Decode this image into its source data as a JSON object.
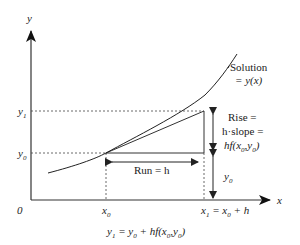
{
  "diagram": {
    "axes": {
      "y_label": "y",
      "x_label": "x",
      "origin_label": "0"
    },
    "labels": {
      "y1": "y",
      "y1_sub": "1",
      "y0": "y",
      "y0_sub": "0",
      "x0": "x",
      "x0_sub": "0",
      "x1_eq": "x",
      "x1_sub": "1",
      "x1_eq_rest_a": " = x",
      "x1_eq_rest_sub": "0",
      "x1_eq_rest_b": " + h",
      "solution_line1": "Solution",
      "solution_line2": "= y(x)",
      "rise_line1": "Rise =",
      "rise_line2": "h·slope =",
      "rise_line3_a": "hf(x",
      "rise_line3_sub1": "0",
      "rise_line3_b": ",y",
      "rise_line3_sub2": "0",
      "rise_line3_c": ")",
      "run": "Run = h",
      "y0_height": "y",
      "y0_height_sub": "0"
    },
    "formula": {
      "a": "y",
      "a_sub": "1",
      "b": " = y",
      "b_sub": "0",
      "c": " + hf(x",
      "c_sub": "0",
      "d": ",y",
      "d_sub": "0",
      "e": ")"
    },
    "colors": {
      "line": "#333333",
      "text": "#222222",
      "background": "#ffffff"
    }
  }
}
